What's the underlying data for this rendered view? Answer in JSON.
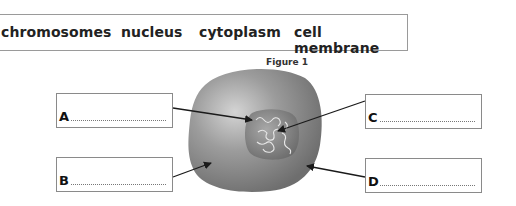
{
  "word_bank": {
    "words": [
      "chromosomes",
      "nucleus",
      "cytoplasm",
      "cell membrane"
    ]
  },
  "figure": {
    "title": "Figure 1",
    "labels": [
      {
        "letter": "A",
        "answer": ""
      },
      {
        "letter": "B",
        "answer": ""
      },
      {
        "letter": "C",
        "answer": ""
      },
      {
        "letter": "D",
        "answer": ""
      }
    ]
  },
  "colors": {
    "cell_body": "#8e8e8e",
    "cell_highlight": "#c8c8c8",
    "nucleus": "#7a7a7a",
    "border": "#8a8a8a",
    "arrow": "#1a1a1a"
  }
}
